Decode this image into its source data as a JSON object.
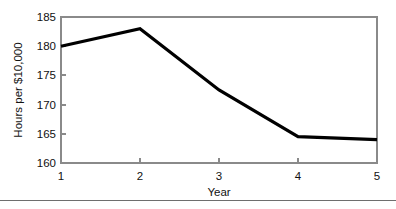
{
  "chart_data": {
    "type": "line",
    "title": "",
    "xlabel": "Year",
    "ylabel": "Hours per $10,000",
    "x": [
      1,
      2,
      3,
      4,
      5
    ],
    "values": [
      180.0,
      183.0,
      172.5,
      164.5,
      164.0
    ],
    "series": [
      {
        "name": "Hours per $10,000",
        "values": [
          180.0,
          183.0,
          172.5,
          164.5,
          164.0
        ]
      }
    ],
    "xtick_labels": [
      "1",
      "2",
      "3",
      "4",
      "5"
    ],
    "ytick_labels": [
      "160",
      "165",
      "170",
      "175",
      "180",
      "185"
    ],
    "yticks": [
      160,
      165,
      170,
      175,
      180,
      185
    ],
    "xlim": [
      1,
      5
    ],
    "ylim": [
      160,
      185
    ],
    "grid": false,
    "legend": "none",
    "line_color": "#000000",
    "axis_color": "#8a8a8a",
    "background_color": "#ffffff"
  }
}
